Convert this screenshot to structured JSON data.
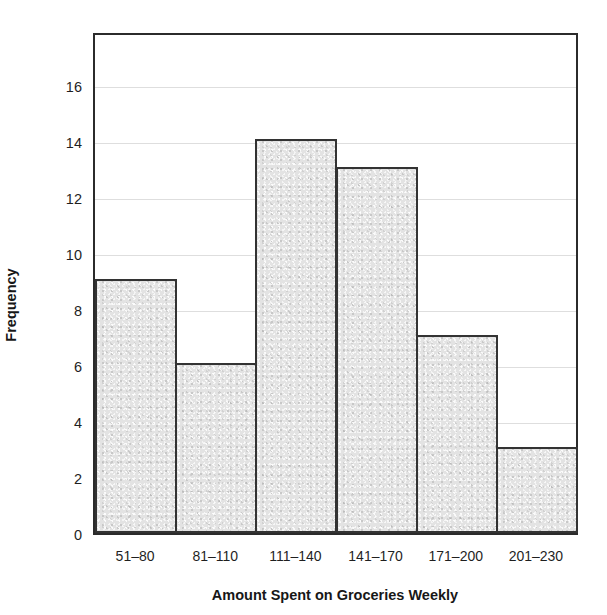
{
  "figure": {
    "title_remnant": "g",
    "axis_color": "#2b2b2b",
    "bar_fill_color": "#e3e3e3",
    "bar_edge_color": "#333333",
    "gridline_color": "#dedede"
  },
  "chart_data": {
    "type": "bar",
    "title": "",
    "xlabel": "Amount Spent on Groceries Weekly",
    "ylabel": "Frequency",
    "categories": [
      "51–80",
      "81–110",
      "111–140",
      "141–170",
      "171–200",
      "201–230"
    ],
    "values": [
      9,
      6,
      14,
      13,
      7,
      3
    ],
    "ytick_labels": [
      "0",
      "2",
      "4",
      "6",
      "8",
      "10",
      "12",
      "14",
      "16"
    ],
    "ytick_values": [
      0,
      2,
      4,
      6,
      8,
      10,
      12,
      14,
      16
    ],
    "ylim": [
      0,
      17.9
    ],
    "xlim_note": "6 contiguous equal-width bins, no gaps",
    "grid": "horizontal gridlines at each even y value, very faint",
    "legend": "none"
  }
}
